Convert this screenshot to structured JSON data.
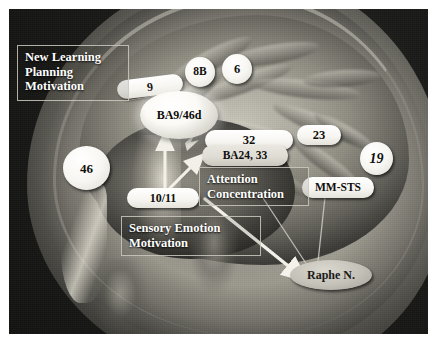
{
  "figure": {
    "background_color": "#ffffff",
    "panel_color": "#151514"
  },
  "region_labels": [
    {
      "id": "ba9",
      "text": "9",
      "shape": "pill",
      "style": "white"
    },
    {
      "id": "ba8b",
      "text": "8B",
      "shape": "circle",
      "style": "white"
    },
    {
      "id": "ba6",
      "text": "6",
      "shape": "circle",
      "style": "white"
    },
    {
      "id": "ba946d",
      "text": "BA9/46d",
      "shape": "ellipse",
      "style": "glow"
    },
    {
      "id": "ba46",
      "text": "46",
      "shape": "circle",
      "style": "white"
    },
    {
      "id": "ba32",
      "text": "32",
      "shape": "pill",
      "style": "white"
    },
    {
      "id": "ba23",
      "text": "23",
      "shape": "pill",
      "style": "white"
    },
    {
      "id": "ba19",
      "text": "19",
      "shape": "circle",
      "style": "white-italic"
    },
    {
      "id": "ba2433",
      "text": "BA24, 33",
      "shape": "pill",
      "style": "gray"
    },
    {
      "id": "mmsts",
      "text": "MM-STS",
      "shape": "pill",
      "style": "white"
    },
    {
      "id": "ba1011",
      "text": "10/11",
      "shape": "pill",
      "style": "white"
    },
    {
      "id": "raphe",
      "text": "Raphe N.",
      "shape": "ellipse",
      "style": "gray"
    }
  ],
  "function_boxes": [
    {
      "id": "box-new-learning",
      "lines": [
        "New Learning",
        "Planning",
        "Motivation"
      ],
      "line1": "New Learning",
      "line2": "Planning",
      "line3": "Motivation"
    },
    {
      "id": "box-attention",
      "lines": [
        "Attention",
        "Concentration"
      ],
      "line1": "Attention",
      "line2": "Concentration"
    },
    {
      "id": "box-sensory",
      "lines": [
        "Sensory Emotion",
        "Motivation"
      ],
      "line1": "Sensory Emotion",
      "line2": "Motivation"
    }
  ],
  "connectors": [
    {
      "id": "arrow-1011-to-ba946d",
      "from": "10/11",
      "to": "BA9/46d",
      "style": "white-thick-arrow"
    },
    {
      "id": "arrow-1011-to-ba2433",
      "from": "10/11",
      "to": "BA24, 33",
      "style": "white-thick-arrow"
    },
    {
      "id": "arrow-1011-to-raphe",
      "from": "10/11",
      "to": "Raphe N.",
      "style": "white-thick-arrow"
    },
    {
      "id": "line-mmsts-to-raphe",
      "from": "MM-STS",
      "to": "Raphe N.",
      "style": "thin-line"
    },
    {
      "id": "line-attention-to-raphe",
      "from": "Attention Concentration",
      "to": "Raphe N.",
      "style": "thin-line"
    },
    {
      "id": "leader-newlearning-to-9",
      "from": "New Learning Planning Motivation",
      "to": "9",
      "style": "leader"
    }
  ]
}
